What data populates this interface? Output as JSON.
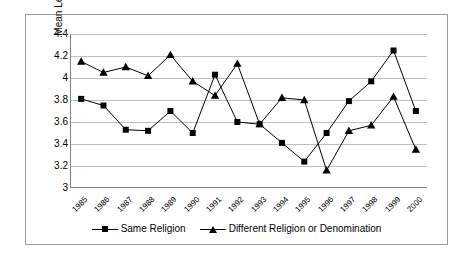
{
  "chart_data": {
    "type": "line",
    "title": "",
    "xlabel": "",
    "ylabel": "Mean Level of Rebellion",
    "ylim": [
      3,
      4.4
    ],
    "ytick_labels": [
      "4.4",
      "4.2",
      "4",
      "3.8",
      "3.6",
      "3.4",
      "3.2",
      "3"
    ],
    "yticks": [
      4.4,
      4.2,
      4.0,
      3.8,
      3.6,
      3.4,
      3.2,
      3.0
    ],
    "grid": true,
    "legend_position": "bottom",
    "categories": [
      "1985",
      "1986",
      "1987",
      "1988",
      "1989",
      "1990",
      "1991",
      "1992",
      "1993",
      "1994",
      "1995",
      "1996",
      "1997",
      "1998",
      "1999",
      "2000"
    ],
    "series": [
      {
        "name": "Same Religion",
        "marker": "square",
        "values": [
          3.81,
          3.75,
          3.53,
          3.52,
          3.7,
          3.5,
          4.03,
          3.6,
          3.58,
          3.41,
          3.24,
          3.5,
          3.79,
          3.97,
          4.25,
          3.7
        ]
      },
      {
        "name": "Different Religion or Denomination",
        "marker": "triangle",
        "values": [
          4.15,
          4.05,
          4.1,
          4.02,
          4.21,
          3.97,
          3.84,
          4.13,
          3.58,
          3.82,
          3.8,
          3.16,
          3.52,
          3.57,
          3.83,
          3.35
        ]
      }
    ]
  },
  "legend": {
    "entries": [
      {
        "label": "Same Religion",
        "marker": "square-marker"
      },
      {
        "label": "Different Religion or Denomination",
        "marker": "triangle-marker"
      }
    ]
  },
  "colors": {
    "series": "#000000",
    "grid": "#bfbfbf",
    "axis": "#808080",
    "frame": "#9a9a9a",
    "background": "#ffffff"
  }
}
